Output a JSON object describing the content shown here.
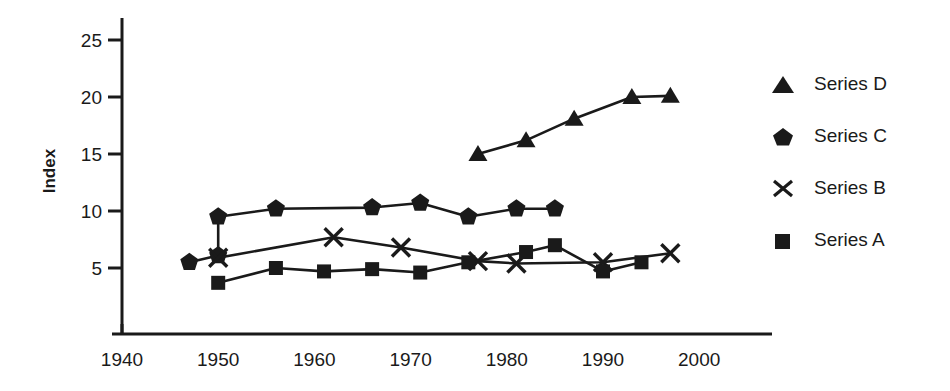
{
  "chart_data": {
    "type": "line",
    "title": "",
    "xlabel": "",
    "ylabel": "Index",
    "xlim": [
      1938,
      2004
    ],
    "ylim": [
      0,
      26.5
    ],
    "xticks": [
      1940,
      1950,
      1960,
      1970,
      1980,
      1990,
      2000
    ],
    "yticks": [
      5,
      10,
      15,
      20,
      25
    ],
    "grid": false,
    "legend_position": "right",
    "series": [
      {
        "name": "Series D",
        "marker": "triangle",
        "color": "#1a1a1a",
        "x": [
          1977,
          1982,
          1987,
          1993,
          1997
        ],
        "y": [
          15.0,
          16.2,
          18.1,
          20.0,
          20.1
        ]
      },
      {
        "name": "Series C",
        "marker": "pentagon",
        "color": "#1a1a1a",
        "x": [
          1947,
          1950,
          1950,
          1956,
          1966,
          1971,
          1976,
          1981,
          1985
        ],
        "y": [
          5.5,
          6.1,
          9.5,
          10.2,
          10.3,
          10.7,
          9.5,
          10.2,
          10.2
        ]
      },
      {
        "name": "Series B",
        "marker": "cross",
        "color": "#1a1a1a",
        "x": [
          1950,
          1962,
          1969,
          1977,
          1981,
          1990,
          1997
        ],
        "y": [
          5.9,
          7.7,
          6.8,
          5.6,
          5.4,
          5.5,
          6.3
        ]
      },
      {
        "name": "Series A",
        "marker": "square",
        "color": "#1a1a1a",
        "x": [
          1950,
          1956,
          1961,
          1966,
          1971,
          1976,
          1982,
          1985,
          1990,
          1994
        ],
        "y": [
          3.7,
          5.0,
          4.7,
          4.9,
          4.6,
          5.5,
          6.4,
          7.0,
          4.7,
          5.5
        ]
      }
    ],
    "legend_entries": [
      {
        "label": "Series D",
        "marker": "triangle"
      },
      {
        "label": "Series C",
        "marker": "pentagon"
      },
      {
        "label": "Series B",
        "marker": "cross"
      },
      {
        "label": "Series A",
        "marker": "square"
      }
    ]
  },
  "axes": {
    "y_title": "Index",
    "y_ticks": [
      "25",
      "20",
      "15",
      "10",
      "5"
    ],
    "x_ticks": [
      "1940",
      "1950",
      "1960",
      "1970",
      "1980",
      "1990",
      "2000"
    ]
  },
  "legend": {
    "items": [
      {
        "label": "Series D"
      },
      {
        "label": "Series C"
      },
      {
        "label": "Series B"
      },
      {
        "label": "Series A"
      }
    ]
  },
  "style": {
    "ink": "#1a1a1a",
    "background": "#ffffff"
  }
}
